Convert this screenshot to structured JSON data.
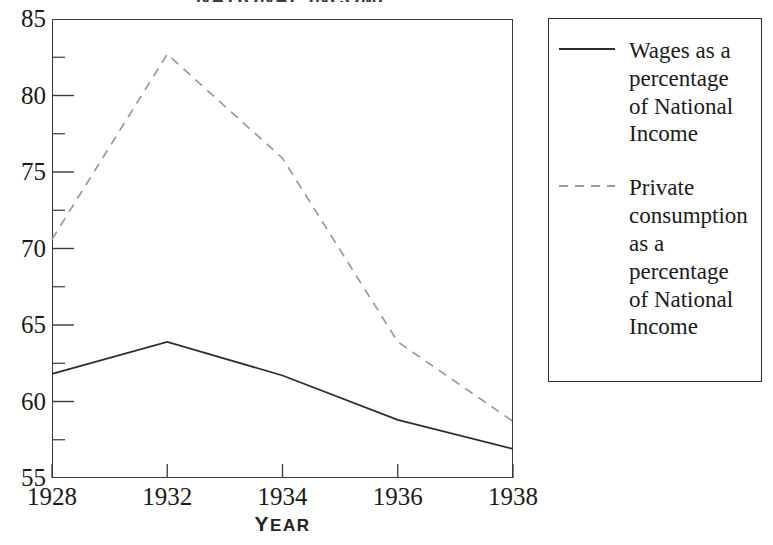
{
  "figure": {
    "title_cropped": "NATIONAL INCOME",
    "title_visible": false
  },
  "chart_data": {
    "type": "line",
    "title": "",
    "xlabel": "YEAR",
    "ylabel": "",
    "categories": [
      "1928",
      "1932",
      "1934",
      "1936",
      "1938"
    ],
    "ylim": [
      55,
      85
    ],
    "y_major_ticks": [
      55,
      60,
      65,
      70,
      75,
      80,
      85
    ],
    "y_minor_ticks": [
      57.5,
      62.5,
      67.5,
      72.5,
      77.5,
      82.5
    ],
    "y_tick_labels": [
      "55",
      "60",
      "65",
      "70",
      "75",
      "80",
      "85"
    ],
    "grid": false,
    "legend_position": "right-outside",
    "series": [
      {
        "name": "Wages as a percentage of National Income",
        "style": "solid",
        "color": "#2e2e2e",
        "values": [
          61.8,
          63.9,
          61.7,
          58.8,
          56.9
        ]
      },
      {
        "name": "Private consumption as a percentage of National Income",
        "style": "dashed",
        "color": "#9a9a9a",
        "values": [
          70.6,
          82.7,
          75.9,
          63.9,
          58.7
        ]
      }
    ]
  },
  "axis": {
    "x_title": "YEAR",
    "x_title_first": "Y",
    "x_title_rest": "EAR"
  },
  "legend": {
    "entries": [
      {
        "swatch": "solid-line-swatch",
        "label": "Wages as a percentage of National Income"
      },
      {
        "swatch": "dashed-line-swatch",
        "label": "Private consumption as a percentage of National Income"
      }
    ]
  },
  "colors": {
    "solid_series": "#2e2e2e",
    "dashed_series": "#9a9a9a",
    "axis": "#3a3a3a",
    "text": "#1a1a1a",
    "background": "#ffffff"
  }
}
